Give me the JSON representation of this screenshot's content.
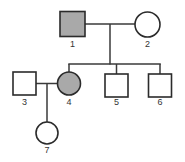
{
  "figure": {
    "kind": "pedigree-chart",
    "width": 185,
    "height": 162,
    "background_color": "#ffffff",
    "line_color": "#3a3a3a",
    "symbol_stroke_color": "#2b2b2b",
    "affected_fill_color": "#a9a9a9",
    "unaffected_fill_color": "#ffffff"
  },
  "individuals": [
    {
      "id": "1",
      "label": "1",
      "sex": "male",
      "shape": "square",
      "status": "affected",
      "fill": "#a9a9a9",
      "generation": 1,
      "x": 72.5,
      "y": 24,
      "size": 25,
      "label_x": 72.5,
      "label_y": 47
    },
    {
      "id": "2",
      "label": "2",
      "sex": "female",
      "shape": "circle",
      "status": "unaffected",
      "fill": "#ffffff",
      "generation": 1,
      "x": 147.5,
      "y": 24.5,
      "size": 25,
      "label_x": 147.5,
      "label_y": 47
    },
    {
      "id": "3",
      "label": "3",
      "sex": "male",
      "shape": "square",
      "status": "unaffected",
      "fill": "#ffffff",
      "generation": 2,
      "x": 24.5,
      "y": 83.5,
      "size": 23,
      "label_x": 24.5,
      "label_y": 105
    },
    {
      "id": "4",
      "label": "4",
      "sex": "female",
      "shape": "circle",
      "status": "affected",
      "fill": "#a9a9a9",
      "generation": 2,
      "x": 69,
      "y": 83.5,
      "size": 23,
      "label_x": 69,
      "label_y": 105
    },
    {
      "id": "5",
      "label": "5",
      "sex": "male",
      "shape": "square",
      "status": "unaffected",
      "fill": "#ffffff",
      "generation": 2,
      "x": 116.5,
      "y": 85.5,
      "size": 23,
      "label_x": 116.5,
      "label_y": 105
    },
    {
      "id": "6",
      "label": "6",
      "sex": "male",
      "shape": "square",
      "status": "unaffected",
      "fill": "#ffffff",
      "generation": 2,
      "x": 160,
      "y": 85.5,
      "size": 23,
      "label_x": 160,
      "label_y": 105
    },
    {
      "id": "7",
      "label": "7",
      "sex": "female",
      "shape": "circle",
      "status": "unaffected",
      "fill": "#ffffff",
      "generation": 3,
      "x": 47,
      "y": 133,
      "size": 22,
      "label_x": 47,
      "label_y": 153
    }
  ],
  "connections": [
    {
      "name": "marriage-line-1-2",
      "x1": 85,
      "y1": 24,
      "x2": 135,
      "y2": 24
    },
    {
      "name": "descent-line-couple-1-2",
      "x1": 110,
      "y1": 24,
      "x2": 110,
      "y2": 64
    },
    {
      "name": "sibship-line-gen2",
      "x1": 69,
      "y1": 64,
      "x2": 160.5,
      "y2": 64
    },
    {
      "name": "drop-line-to-4",
      "x1": 69,
      "y1": 64,
      "x2": 69,
      "y2": 72.5
    },
    {
      "name": "drop-line-to-5",
      "x1": 116.5,
      "y1": 64,
      "x2": 116.5,
      "y2": 74
    },
    {
      "name": "drop-line-to-6",
      "x1": 160,
      "y1": 64,
      "x2": 160,
      "y2": 74
    },
    {
      "name": "marriage-line-3-4",
      "x1": 36,
      "y1": 83.5,
      "x2": 57.5,
      "y2": 83.5
    },
    {
      "name": "descent-line-couple-3-4",
      "x1": 47,
      "y1": 83.5,
      "x2": 47,
      "y2": 122
    }
  ],
  "legend": {
    "square_meaning": "male",
    "circle_meaning": "female",
    "shaded_meaning": "affected",
    "open_meaning": "unaffected"
  }
}
